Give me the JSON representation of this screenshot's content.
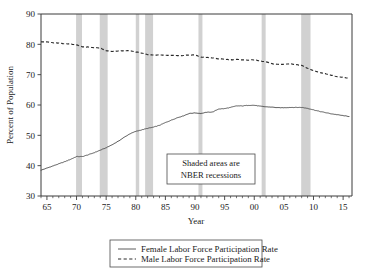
{
  "chart_data": {
    "type": "line",
    "title": "",
    "xlabel": "Year",
    "ylabel": "Percent of Population",
    "xlim": [
      1964,
      2016.5
    ],
    "ylim": [
      30,
      90
    ],
    "grid": false,
    "legend_position": "bottom-outside",
    "x_ticks": [
      {
        "value": 1965,
        "label": "65"
      },
      {
        "value": 1970,
        "label": "70"
      },
      {
        "value": 1975,
        "label": "75"
      },
      {
        "value": 1980,
        "label": "80"
      },
      {
        "value": 1985,
        "label": "85"
      },
      {
        "value": 1990,
        "label": "90"
      },
      {
        "value": 1995,
        "label": "95"
      },
      {
        "value": 2000,
        "label": "00"
      },
      {
        "value": 2005,
        "label": "05"
      },
      {
        "value": 2010,
        "label": "10"
      },
      {
        "value": 2015,
        "label": "15"
      }
    ],
    "y_ticks": [
      {
        "value": 30,
        "label": "30"
      },
      {
        "value": 40,
        "label": "40"
      },
      {
        "value": 50,
        "label": "50"
      },
      {
        "value": 60,
        "label": "60"
      },
      {
        "value": 70,
        "label": "70"
      },
      {
        "value": 80,
        "label": "80"
      },
      {
        "value": 90,
        "label": "90"
      }
    ],
    "x": [
      1964,
      1965,
      1966,
      1967,
      1968,
      1969,
      1970,
      1971,
      1972,
      1973,
      1974,
      1975,
      1976,
      1977,
      1978,
      1979,
      1980,
      1981,
      1982,
      1983,
      1984,
      1985,
      1986,
      1987,
      1988,
      1989,
      1990,
      1991,
      1992,
      1993,
      1994,
      1995,
      1996,
      1997,
      1998,
      1999,
      2000,
      2001,
      2002,
      2003,
      2004,
      2005,
      2006,
      2007,
      2008,
      2009,
      2010,
      2011,
      2012,
      2013,
      2014,
      2015,
      2016
    ],
    "series": [
      {
        "name": "Female Labor Force Participation Rate",
        "style": "solid",
        "color": "#4a4a4a",
        "values": [
          38.5,
          39.2,
          39.9,
          40.6,
          41.3,
          42.1,
          43.0,
          43.0,
          43.6,
          44.3,
          45.1,
          45.9,
          46.9,
          48.0,
          49.3,
          50.5,
          51.3,
          51.8,
          52.3,
          52.7,
          53.3,
          54.2,
          55.0,
          55.8,
          56.4,
          57.2,
          57.4,
          57.2,
          57.6,
          57.7,
          58.7,
          58.8,
          59.2,
          59.7,
          59.7,
          59.9,
          59.9,
          59.6,
          59.4,
          59.3,
          59.1,
          59.1,
          59.2,
          59.2,
          59.2,
          58.9,
          58.4,
          57.9,
          57.5,
          57.1,
          56.8,
          56.5,
          56.2
        ]
      },
      {
        "name": "Male Labor Force Participation Rate",
        "style": "dashed",
        "color": "#2a2a2a",
        "values": [
          80.9,
          80.8,
          80.5,
          80.4,
          80.2,
          80.1,
          79.8,
          79.2,
          79.1,
          78.9,
          78.8,
          77.9,
          77.6,
          77.8,
          77.9,
          77.9,
          77.5,
          77.1,
          76.6,
          76.5,
          76.5,
          76.4,
          76.4,
          76.3,
          76.3,
          76.5,
          76.5,
          75.8,
          75.7,
          75.5,
          75.2,
          75.1,
          74.9,
          75.0,
          74.9,
          74.8,
          74.9,
          74.5,
          74.2,
          73.6,
          73.4,
          73.4,
          73.6,
          73.3,
          73.1,
          72.1,
          71.3,
          70.7,
          70.3,
          69.8,
          69.3,
          69.1,
          68.8
        ]
      }
    ],
    "recessions": [
      {
        "start": 1969.92,
        "end": 1970.92,
        "label": "1969-1970"
      },
      {
        "start": 1973.92,
        "end": 1975.25,
        "label": "1973-1975"
      },
      {
        "start": 1980.0,
        "end": 1980.58,
        "label": "1980"
      },
      {
        "start": 1981.58,
        "end": 1982.92,
        "label": "1981-1982"
      },
      {
        "start": 1990.58,
        "end": 1991.25,
        "label": "1990-1991"
      },
      {
        "start": 2001.25,
        "end": 2001.92,
        "label": "2001"
      },
      {
        "start": 2007.92,
        "end": 2009.5,
        "label": "2007-2009"
      }
    ],
    "recession_color": "#c9c9c9",
    "annotation": {
      "line1": "Shaded areas are",
      "line2": "NBER recessions"
    },
    "legend": [
      {
        "label": "Female Labor Force Participation Rate",
        "style": "solid"
      },
      {
        "label": "Male Labor Force Participation Rate",
        "style": "dashed"
      }
    ]
  }
}
